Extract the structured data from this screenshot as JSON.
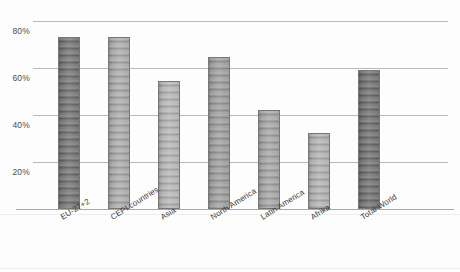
{
  "chart_data": {
    "type": "bar",
    "title": "",
    "subtitle": "",
    "xlabel": "",
    "ylabel": "",
    "ylim": [
      0,
      80
    ],
    "ytick_values": [
      20,
      40,
      60,
      80
    ],
    "ytick_labels": [
      "20%",
      "40%",
      "60%",
      "80%"
    ],
    "grid": "horizontal",
    "legend": "none",
    "value_unit": "%",
    "categories": [
      "EU-27+2",
      "CEPI countries",
      "Asia",
      "North America",
      "Latin America",
      "Afrika",
      "Total World"
    ],
    "values": [
      73,
      73,
      54.5,
      64.5,
      42,
      32.5,
      59
    ],
    "bar_colors": [
      "#6f6f6f",
      "#a9a9a9",
      "#b4b4b4",
      "#9b9b9b",
      "#a3a3a3",
      "#b0b0b0",
      "#6b6b6b"
    ],
    "bar_border_color": "#777777",
    "gridline_color": "#b9b9b9",
    "axis_color": "#a9a9a9",
    "background_color": "#fdfdfd",
    "text_color": "#3c3c3c"
  },
  "axis": {
    "y_ticks": [
      {
        "label": "80%",
        "value": 80
      },
      {
        "label": "60%",
        "value": 60
      },
      {
        "label": "40%",
        "value": 40
      },
      {
        "label": "20%",
        "value": 20
      }
    ]
  }
}
